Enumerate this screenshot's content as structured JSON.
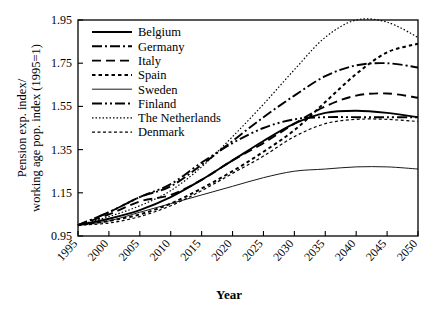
{
  "chart_data": {
    "type": "line",
    "title": "",
    "xlabel": "Year",
    "ylabel": "Pension exp. index/ working age pop. index (1995=1)",
    "ylabel_line1": "Pension exp. index/",
    "ylabel_line2": "working age pop. index (1995=1)",
    "xlim": [
      1995,
      2050
    ],
    "ylim": [
      0.95,
      1.95
    ],
    "xticks": [
      1995,
      2000,
      2005,
      2010,
      2015,
      2020,
      2025,
      2030,
      2035,
      2040,
      2045,
      2050
    ],
    "yticks": [
      0.95,
      1.15,
      1.35,
      1.55,
      1.75,
      1.95
    ],
    "ytick_labels": [
      "0.95",
      "1.15",
      "1.35",
      "1.55",
      "1.75",
      "1.95"
    ],
    "xtick_labels": [
      "1995",
      "2000",
      "2005",
      "2010",
      "2015",
      "2020",
      "2025",
      "2030",
      "2035",
      "2040",
      "2045",
      "2050"
    ],
    "grid": false,
    "legend_position": "upper left",
    "x": [
      1995,
      2000,
      2005,
      2010,
      2015,
      2020,
      2025,
      2030,
      2035,
      2040,
      2045,
      2050
    ],
    "series": [
      {
        "name": "Belgium",
        "style": "solid",
        "width": 1.9,
        "dash": "none",
        "values": [
          1.0,
          1.03,
          1.07,
          1.13,
          1.21,
          1.3,
          1.39,
          1.47,
          1.52,
          1.53,
          1.52,
          1.5
        ]
      },
      {
        "name": "Germany",
        "style": "dash-dot",
        "width": 1.9,
        "dash": "10,3,2,3",
        "values": [
          1.0,
          1.06,
          1.13,
          1.18,
          1.28,
          1.39,
          1.5,
          1.6,
          1.69,
          1.74,
          1.75,
          1.73
        ]
      },
      {
        "name": "Italy",
        "style": "dashed",
        "width": 1.9,
        "dash": "9,5",
        "values": [
          1.0,
          1.05,
          1.11,
          1.14,
          1.21,
          1.3,
          1.38,
          1.47,
          1.55,
          1.6,
          1.61,
          1.59
        ]
      },
      {
        "name": "Spain",
        "style": "dotted-medium",
        "width": 2.0,
        "dash": "3.5,3",
        "values": [
          1.0,
          1.02,
          1.05,
          1.1,
          1.17,
          1.25,
          1.34,
          1.44,
          1.57,
          1.7,
          1.8,
          1.84
        ]
      },
      {
        "name": "Sweden",
        "style": "solid-thin",
        "width": 0.9,
        "dash": "none",
        "values": [
          1.0,
          1.02,
          1.06,
          1.1,
          1.14,
          1.18,
          1.22,
          1.25,
          1.26,
          1.27,
          1.27,
          1.26
        ]
      },
      {
        "name": "Finland",
        "style": "dash-dot-dot",
        "width": 1.9,
        "dash": "10,3,2,3,2,3",
        "values": [
          1.0,
          1.06,
          1.13,
          1.19,
          1.29,
          1.38,
          1.45,
          1.49,
          1.5,
          1.5,
          1.5,
          1.5
        ]
      },
      {
        "name": "The Netherlands",
        "style": "dotted-fine",
        "width": 1.2,
        "dash": "1.5,2",
        "values": [
          1.0,
          1.04,
          1.09,
          1.16,
          1.27,
          1.41,
          1.56,
          1.72,
          1.87,
          1.95,
          1.94,
          1.87
        ]
      },
      {
        "name": "Denmark",
        "style": "dotted-small-dash",
        "width": 1.2,
        "dash": "3,2.5",
        "values": [
          1.0,
          1.01,
          1.04,
          1.09,
          1.16,
          1.24,
          1.32,
          1.41,
          1.47,
          1.49,
          1.49,
          1.48
        ]
      }
    ]
  },
  "legend": {
    "entries": [
      {
        "label": "Belgium"
      },
      {
        "label": "Germany"
      },
      {
        "label": "Italy"
      },
      {
        "label": "Spain"
      },
      {
        "label": "Sweden"
      },
      {
        "label": "Finland"
      },
      {
        "label": "The Netherlands"
      },
      {
        "label": "Denmark"
      }
    ]
  },
  "colors": {
    "line": "#000000",
    "axis": "#000000",
    "background": "#ffffff"
  }
}
